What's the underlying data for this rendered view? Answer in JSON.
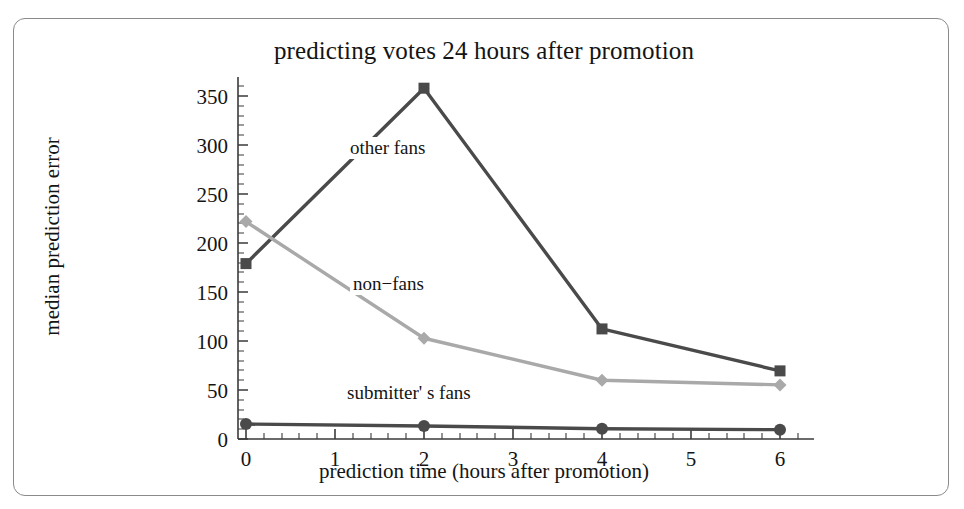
{
  "figure": {
    "title": "predicting votes 24 hours after promotion",
    "xlabel": "prediction time (hours after promotion)",
    "ylabel": "median prediction error"
  },
  "axes": {
    "ytick_labels": [
      "0",
      "50",
      "100",
      "150",
      "200",
      "250",
      "300",
      "350"
    ],
    "xtick_labels": [
      "0",
      "1",
      "2",
      "3",
      "4",
      "5",
      "6"
    ]
  },
  "series_labels": {
    "other_fans": "other fans",
    "non_fans": "non−fans",
    "submitters_fans": "submitter' s fans"
  },
  "colors": {
    "other_fans": "#4a4a4a",
    "non_fans": "#a9a9a9",
    "submitters_fans": "#4a4a4a",
    "axis": "#3a3a3a",
    "text": "#141414",
    "card_border": "#8a8a8a",
    "background": "#ffffff"
  },
  "chart_data": {
    "type": "line",
    "title": "predicting votes 24 hours after promotion",
    "xlabel": "prediction time (hours after promotion)",
    "ylabel": "median prediction error",
    "x": [
      0,
      2,
      4,
      6
    ],
    "xlim": [
      -0.15,
      6.2
    ],
    "ylim": [
      -8,
      380
    ],
    "xticks": [
      0,
      1,
      2,
      3,
      4,
      5,
      6
    ],
    "yticks": [
      0,
      50,
      100,
      150,
      200,
      250,
      300,
      350
    ],
    "grid": false,
    "legend": "inline-annotations",
    "series": [
      {
        "name": "other fans",
        "marker": "square",
        "color": "#4a4a4a",
        "values": [
          180,
          368,
          110,
          65
        ]
      },
      {
        "name": "non−fans",
        "marker": "diamond",
        "color": "#a9a9a9",
        "values": [
          225,
          100,
          55,
          50
        ]
      },
      {
        "name": "submitter' s fans",
        "marker": "circle",
        "color": "#4a4a4a",
        "values": [
          8,
          6,
          3,
          2
        ]
      }
    ]
  }
}
